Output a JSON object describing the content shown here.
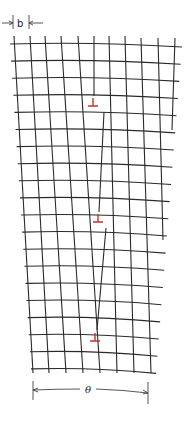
{
  "figure": {
    "labels": {
      "spacing": "b",
      "angle": "θ"
    },
    "colors": {
      "lattice": "#2a2a2a",
      "dislocation": "#c0392b",
      "background": "#ffffff"
    },
    "lattice": {
      "top_y": 44,
      "row_spacing": 17.1,
      "rows": 20,
      "top_columns_x": [
        14,
        30,
        45,
        61,
        78,
        94,
        109,
        125,
        141,
        158,
        175
      ],
      "bottom_columns_x": [
        33,
        49,
        66,
        83,
        100,
        117,
        134,
        151
      ],
      "bottom_y": 373
    },
    "dislocations": [
      {
        "symbol": "⊥",
        "x": 93,
        "y": 103
      },
      {
        "symbol": "⊥",
        "x": 98,
        "y": 219
      },
      {
        "symbol": "⊥",
        "x": 95,
        "y": 338
      }
    ],
    "dimension_top": {
      "left_tick_x": 13,
      "right_tick_x": 29,
      "y": 23,
      "label": "b"
    },
    "dimension_bottom": {
      "left_tick_x": 33,
      "right_tick_x": 148,
      "y": 390,
      "label": "θ"
    }
  }
}
